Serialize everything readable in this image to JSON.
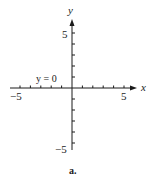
{
  "figure": {
    "caption": "a.",
    "equation_label": "y = 0",
    "x_axis": {
      "name": "x",
      "tick_labels": {
        "min": "−5",
        "max": "5"
      },
      "range": [
        -5,
        5
      ],
      "ticks": [
        -5,
        -4,
        -3,
        -2,
        -1,
        1,
        2,
        3,
        4,
        5
      ]
    },
    "y_axis": {
      "name": "y",
      "tick_labels": {
        "min": "−5",
        "max": "5"
      },
      "range": [
        -5,
        5
      ],
      "ticks": [
        -5,
        -4,
        -3,
        -2,
        -1,
        1,
        2,
        3,
        4,
        5
      ]
    },
    "colors": {
      "ink": "#1a1a1a",
      "background": "#ffffff"
    }
  }
}
